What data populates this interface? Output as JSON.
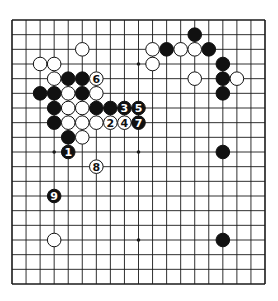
{
  "diagram": {
    "type": "go-board",
    "size": 19,
    "colors": {
      "board": "#ffffff",
      "line": "#1a1a1a",
      "black": "#111111",
      "white": "#ffffff"
    },
    "star_points": [
      [
        3,
        3
      ],
      [
        9,
        3
      ],
      [
        15,
        3
      ],
      [
        3,
        9
      ],
      [
        9,
        9
      ],
      [
        15,
        9
      ],
      [
        3,
        15
      ],
      [
        9,
        15
      ],
      [
        15,
        15
      ]
    ],
    "black_stones": [
      [
        13,
        1
      ],
      [
        11,
        2
      ],
      [
        14,
        2
      ],
      [
        15,
        3
      ],
      [
        4,
        4
      ],
      [
        5,
        4
      ],
      [
        15,
        4
      ],
      [
        2,
        5
      ],
      [
        3,
        5
      ],
      [
        5,
        5
      ],
      [
        15,
        5
      ],
      [
        3,
        6
      ],
      [
        6,
        6
      ],
      [
        7,
        6
      ],
      [
        3,
        7
      ],
      [
        4,
        8
      ],
      [
        15,
        9
      ],
      [
        15,
        15
      ]
    ],
    "white_stones": [
      [
        5,
        2
      ],
      [
        10,
        2
      ],
      [
        12,
        2
      ],
      [
        13,
        2
      ],
      [
        2,
        3
      ],
      [
        3,
        3
      ],
      [
        10,
        3
      ],
      [
        3,
        4
      ],
      [
        13,
        4
      ],
      [
        16,
        4
      ],
      [
        4,
        5
      ],
      [
        6,
        5
      ],
      [
        4,
        6
      ],
      [
        5,
        6
      ],
      [
        4,
        7
      ],
      [
        5,
        7
      ],
      [
        6,
        7
      ],
      [
        5,
        8
      ],
      [
        3,
        15
      ]
    ],
    "numbered_moves": [
      {
        "n": "1",
        "color": "black",
        "col": 4,
        "row": 9
      },
      {
        "n": "2",
        "color": "white",
        "col": 7,
        "row": 7
      },
      {
        "n": "3",
        "color": "black",
        "col": 8,
        "row": 6
      },
      {
        "n": "4",
        "color": "white",
        "col": 8,
        "row": 7
      },
      {
        "n": "5",
        "color": "black",
        "col": 9,
        "row": 6
      },
      {
        "n": "6",
        "color": "white",
        "col": 6,
        "row": 4
      },
      {
        "n": "7",
        "color": "black",
        "col": 9,
        "row": 7
      },
      {
        "n": "8",
        "color": "white",
        "col": 6,
        "row": 10
      },
      {
        "n": "9",
        "color": "black",
        "col": 3,
        "row": 12
      }
    ]
  }
}
